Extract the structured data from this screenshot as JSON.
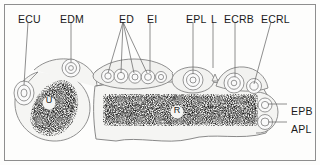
{
  "figure": {
    "border_color": "#8e8e8e",
    "outline_color": "#7a7a7a",
    "stipple_color": "#2b2b2b",
    "fill_color": "#f4f4f2",
    "background": "#fdfdfc"
  },
  "top_labels": [
    {
      "text": "ECU",
      "x": 18,
      "y": 14
    },
    {
      "text": "EDM",
      "x": 60,
      "y": 14
    },
    {
      "text": "ED",
      "x": 119,
      "y": 14
    },
    {
      "text": "EI",
      "x": 147,
      "y": 14
    },
    {
      "text": "EPL",
      "x": 186,
      "y": 14
    },
    {
      "text": "L",
      "x": 211,
      "y": 14
    },
    {
      "text": "ECRB",
      "x": 224,
      "y": 14
    },
    {
      "text": "ECRL",
      "x": 261,
      "y": 14
    }
  ],
  "right_labels": [
    {
      "text": "EPB",
      "x": 291,
      "y": 106
    },
    {
      "text": "APL",
      "x": 291,
      "y": 124
    }
  ],
  "bone_labels": [
    {
      "text": "U",
      "x": 49,
      "y": 103
    },
    {
      "text": "R",
      "x": 177,
      "y": 113
    }
  ],
  "leader_lines": [
    {
      "name": "ecu-leader",
      "x1": 28,
      "y1": 22,
      "x2": 24,
      "y2": 85
    },
    {
      "name": "edm-leader",
      "x1": 71,
      "y1": 22,
      "x2": 71,
      "y2": 62
    },
    {
      "name": "ed-leader-1",
      "x1": 123,
      "y1": 22,
      "x2": 108,
      "y2": 73
    },
    {
      "name": "ed-leader-2",
      "x1": 123,
      "y1": 22,
      "x2": 121,
      "y2": 73
    },
    {
      "name": "ed-leader-3",
      "x1": 123,
      "y1": 22,
      "x2": 134,
      "y2": 73
    },
    {
      "name": "ed-leader-4",
      "x1": 123,
      "y1": 22,
      "x2": 147,
      "y2": 73
    },
    {
      "name": "ei-leader",
      "x1": 150,
      "y1": 22,
      "x2": 150,
      "y2": 73
    },
    {
      "name": "epl-leader",
      "x1": 193,
      "y1": 22,
      "x2": 193,
      "y2": 74
    },
    {
      "name": "l-leader",
      "x1": 213,
      "y1": 22,
      "x2": 213,
      "y2": 68
    },
    {
      "name": "ecrb-leader",
      "x1": 235,
      "y1": 22,
      "x2": 235,
      "y2": 77
    },
    {
      "name": "ecrl-leader",
      "x1": 271,
      "y1": 22,
      "x2": 254,
      "y2": 84
    },
    {
      "name": "epb-leader",
      "x1": 287,
      "y1": 104,
      "x2": 268,
      "y2": 104
    },
    {
      "name": "apl-leader",
      "x1": 287,
      "y1": 122,
      "x2": 268,
      "y2": 122
    }
  ],
  "structures": {
    "ulna": {
      "name": "ulna-cross-section",
      "cx": 52,
      "cy": 105,
      "r": 37
    },
    "radius": {
      "name": "radius-cross-section"
    },
    "ecu_tendon": {
      "cx": 24,
      "cy": 93,
      "rings": 3
    },
    "edm_tendon": {
      "cx": 71,
      "cy": 68,
      "rings": 3
    },
    "ed_tendons": [
      {
        "cx": 108,
        "cy": 76
      },
      {
        "cx": 121,
        "cy": 76
      },
      {
        "cx": 134,
        "cy": 76
      },
      {
        "cx": 147,
        "cy": 76
      }
    ],
    "ei_tendon": {
      "cx": 158,
      "cy": 77
    },
    "epl_tendon": {
      "cx": 193,
      "cy": 80,
      "rings": 3
    },
    "ecrb_tendon": {
      "cx": 235,
      "cy": 83,
      "rings": 3
    },
    "ecrl_tendon": {
      "cx": 253,
      "cy": 86,
      "rings": 2
    },
    "epb_tendon": {
      "cx": 265,
      "cy": 105,
      "rings": 2
    },
    "apl_tendon": {
      "cx": 265,
      "cy": 122,
      "rings": 2
    }
  }
}
